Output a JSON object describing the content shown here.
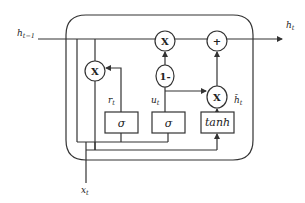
{
  "diagram": {
    "type": "GRU cell",
    "colors": {
      "stroke": "#333333",
      "background": "#ffffff",
      "text": "#222222"
    },
    "inputs": {
      "prev_hidden": {
        "base": "h",
        "sub": "t−1"
      },
      "input": {
        "base": "x",
        "sub": "t"
      }
    },
    "outputs": {
      "hidden": {
        "base": "h",
        "sub": "t"
      }
    },
    "signals": {
      "reset_gate": {
        "base": "r",
        "sub": "t"
      },
      "update_gate": {
        "base": "u",
        "sub": "t"
      },
      "candidate": {
        "base": "h̃",
        "sub": "t"
      }
    },
    "operators": {
      "reset_multiply": "X",
      "update_multiply": "X",
      "one_minus": "1-",
      "add": "+",
      "candidate_multiply": "X"
    },
    "activations": {
      "reset": "σ",
      "update": "σ",
      "candidate": "tanh"
    }
  }
}
